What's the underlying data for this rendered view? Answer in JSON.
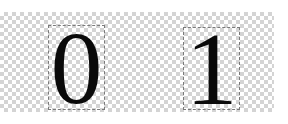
{
  "canvas": {
    "background": "transparency-checkerboard",
    "glyphs": [
      {
        "label": "0",
        "color": "#0a0a0a"
      },
      {
        "label": "1",
        "color": "#0a0a0a"
      }
    ]
  }
}
